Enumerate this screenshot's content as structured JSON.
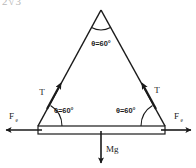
{
  "figure": {
    "type": "free-body-diagram",
    "background_color": "#ffffff",
    "line_color": "#1a1a1a",
    "clipped_top_text": "2√3"
  },
  "geometry": {
    "apex": {
      "x": 101,
      "y": 10
    },
    "bottom_left": {
      "x": 38,
      "y": 126
    },
    "bottom_right": {
      "x": 165,
      "y": 126
    },
    "rod_left_x": 38,
    "rod_right_x": 165,
    "rod_top_y": 126,
    "rod_bottom_y": 134
  },
  "angles": {
    "apex": {
      "label": "θ=60°",
      "value": 60,
      "unit": "degrees",
      "x": 101,
      "y": 46
    },
    "bottom_left": {
      "label": "θ=60°",
      "value": 60,
      "unit": "degrees",
      "x": 58,
      "y": 110
    },
    "bottom_right": {
      "label": "θ=60°",
      "value": 60,
      "unit": "degrees",
      "x": 118,
      "y": 110
    }
  },
  "forces": {
    "tension_left": {
      "label": "T",
      "x": 43,
      "y": 93
    },
    "tension_right": {
      "label": "T",
      "x": 156,
      "y": 91
    },
    "weight": {
      "label": "Mg",
      "x": 110,
      "y": 150
    },
    "force_left": {
      "symbol": "F",
      "subscript": "e",
      "x": 13,
      "y": 116
    },
    "force_right": {
      "symbol": "F",
      "subscript": "e",
      "x": 176,
      "y": 116
    }
  },
  "arrows": {
    "tension_left_direction": "up-right toward apex",
    "tension_right_direction": "up-left toward apex",
    "weight_direction": "down",
    "force_left_direction": "left",
    "force_right_direction": "right"
  }
}
